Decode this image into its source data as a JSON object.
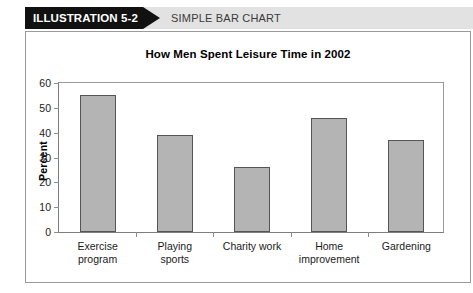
{
  "header": {
    "badge_label": "ILLUSTRATION 5-2",
    "caption": "SIMPLE BAR CHART",
    "badge_bg": "#111111",
    "band_bg": "#e2e2e2"
  },
  "chart_data": {
    "type": "bar",
    "title": "How Men Spent Leisure Time in 2002",
    "xlabel": "",
    "ylabel": "Percent",
    "categories": [
      "Exercise\nprogram",
      "Playing\nsports",
      "Charity work",
      "Home\nimprovement",
      "Gardening"
    ],
    "values": [
      55,
      39,
      26,
      46,
      37
    ],
    "ylim": [
      0,
      60
    ],
    "yticks": [
      0,
      10,
      20,
      30,
      40,
      50,
      60
    ],
    "ytick_labels": [
      "0",
      "10",
      "20",
      "30",
      "40",
      "50",
      "60"
    ],
    "grid": false,
    "legend": null,
    "bar_color": "#b4b4b4",
    "bar_edge_color": "#555555"
  }
}
